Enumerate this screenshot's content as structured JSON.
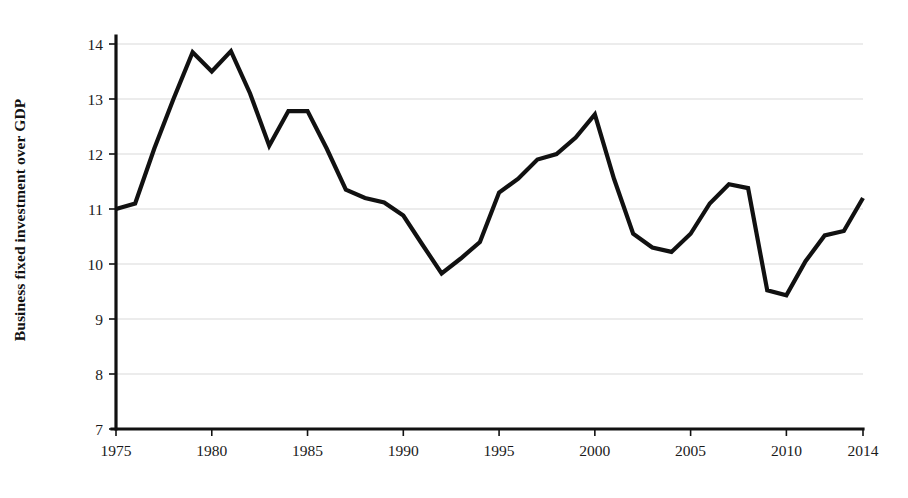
{
  "chart_data": {
    "type": "line",
    "title": "",
    "subtitle": "",
    "xlabel": "",
    "ylabel": "Business fixed investment over GDP",
    "xlim": [
      1975,
      2014
    ],
    "ylim": [
      7,
      14
    ],
    "grid": "horizontal",
    "legend": "none",
    "y_ticks": [
      7,
      8,
      9,
      10,
      11,
      12,
      13,
      14
    ],
    "y_tick_labels": [
      "7",
      "8",
      "9",
      "10",
      "11",
      "12",
      "13",
      "14"
    ],
    "x_ticks": [
      1975,
      1980,
      1985,
      1990,
      1995,
      2000,
      2005,
      2010,
      2014
    ],
    "x_tick_labels": [
      "1975",
      "1980",
      "1985",
      "1990",
      "1995",
      "2000",
      "2005",
      "2010",
      "2014"
    ],
    "line_color": "#111111",
    "grid_color": "#d9d9d9",
    "axis_color": "#111111",
    "x": [
      1975,
      1976,
      1977,
      1978,
      1979,
      1980,
      1981,
      1982,
      1983,
      1984,
      1985,
      1986,
      1987,
      1988,
      1989,
      1990,
      1991,
      1992,
      1993,
      1994,
      1995,
      1996,
      1997,
      1998,
      1999,
      2000,
      2001,
      2002,
      2003,
      2004,
      2005,
      2006,
      2007,
      2008,
      2009,
      2010,
      2011,
      2012,
      2013,
      2014
    ],
    "values": [
      11.0,
      11.1,
      12.1,
      13.0,
      13.85,
      13.5,
      13.87,
      13.1,
      12.15,
      12.78,
      12.78,
      12.1,
      11.35,
      11.2,
      11.12,
      10.88,
      10.35,
      9.83,
      10.1,
      10.4,
      11.3,
      11.55,
      11.9,
      12.0,
      12.3,
      12.72,
      11.55,
      10.55,
      10.3,
      10.22,
      10.55,
      11.1,
      11.45,
      11.38,
      9.52,
      9.43,
      10.05,
      10.52,
      10.6,
      11.2
    ],
    "series": [
      {
        "name": "Business fixed investment over GDP",
        "values": [
          11.0,
          11.1,
          12.1,
          13.0,
          13.85,
          13.5,
          13.87,
          13.1,
          12.15,
          12.78,
          12.78,
          12.1,
          11.35,
          11.2,
          11.12,
          10.88,
          10.35,
          9.83,
          10.1,
          10.4,
          11.3,
          11.55,
          11.9,
          12.0,
          12.3,
          12.72,
          11.55,
          10.55,
          10.3,
          10.22,
          10.55,
          11.1,
          11.45,
          11.38,
          9.52,
          9.43,
          10.05,
          10.52,
          10.6,
          11.2
        ]
      }
    ]
  }
}
